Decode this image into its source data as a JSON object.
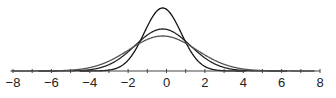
{
  "chart_data": {
    "type": "line",
    "title": "",
    "xlabel": "",
    "ylabel": "",
    "xlim": [
      -8,
      8
    ],
    "x_ticks": [
      -8,
      -7,
      -6,
      -5,
      -4,
      -3,
      -2,
      -1,
      0,
      1,
      2,
      3,
      4,
      5,
      6,
      7,
      8
    ],
    "x_tick_labels": [
      "−8",
      "−6",
      "−4",
      "−2",
      "0",
      "2",
      "4",
      "6",
      "8"
    ],
    "x_tick_label_values": [
      -8,
      -6,
      -4,
      -2,
      0,
      2,
      4,
      6,
      8
    ],
    "grid": false,
    "legend": null,
    "series": [
      {
        "name": "curve-narrow",
        "kind": "normal-density",
        "mean": -0.2,
        "sigma": 0.6,
        "peak_px_height": 63,
        "line_color": "#111111"
      },
      {
        "name": "curve-medium",
        "kind": "normal-density",
        "mean": -0.2,
        "sigma": 0.9,
        "peak_px_height": 42,
        "line_color": "#222222"
      },
      {
        "name": "curve-wide",
        "kind": "normal-density",
        "mean": -0.2,
        "sigma": 1.1,
        "peak_px_height": 35,
        "line_color": "#555555"
      }
    ]
  },
  "layout": {
    "axis_y": 71,
    "x_min_px": 13,
    "x_max_px": 320
  }
}
